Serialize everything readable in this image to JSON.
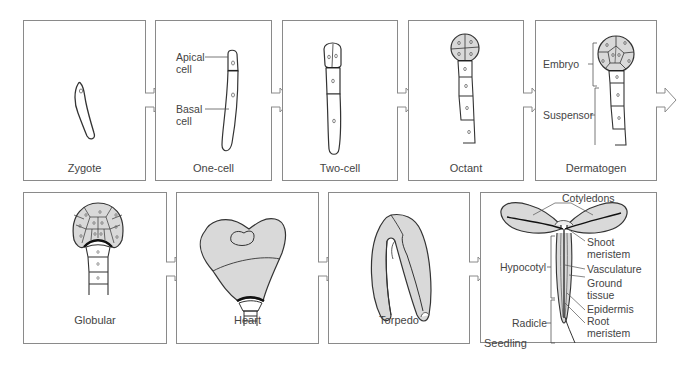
{
  "colors": {
    "panel_border": "#8a8a8a",
    "tissue_fill": "#d9d9d9",
    "outline": "#333333",
    "text": "#444444"
  },
  "stages": [
    {
      "id": "zygote",
      "caption": "Zygote",
      "labels": []
    },
    {
      "id": "one-cell",
      "caption": "One-cell",
      "labels": [
        {
          "text_line1": "Apical",
          "text_line2": "cell"
        },
        {
          "text_line1": "Basal",
          "text_line2": "cell"
        }
      ]
    },
    {
      "id": "two-cell",
      "caption": "Two-cell",
      "labels": []
    },
    {
      "id": "octant",
      "caption": "Octant",
      "labels": []
    },
    {
      "id": "dermatogen",
      "caption": "Dermatogen",
      "labels": [
        {
          "text": "Embryo"
        },
        {
          "text": "Suspensor"
        }
      ]
    },
    {
      "id": "globular",
      "caption": "Globular",
      "labels": []
    },
    {
      "id": "heart",
      "caption": "Heart",
      "labels": []
    },
    {
      "id": "torpedo",
      "caption": "Torpedo",
      "labels": []
    },
    {
      "id": "seedling",
      "caption": "Seedling",
      "labels": [
        {
          "text": "Cotyledons"
        },
        {
          "text_line1": "Shoot",
          "text_line2": "meristem"
        },
        {
          "text": "Hypocotyl"
        },
        {
          "text": "Vasculature"
        },
        {
          "text_line1": "Ground",
          "text_line2": "tissue"
        },
        {
          "text": "Epidermis"
        },
        {
          "text": "Radicle"
        },
        {
          "text_line1": "Root",
          "text_line2": "meristem"
        }
      ]
    }
  ],
  "arrows": [
    "zygote-to-one-cell",
    "one-cell-to-two-cell",
    "two-cell-to-octant",
    "octant-to-dermatogen",
    "dermatogen-to-next-row",
    "globular-to-heart",
    "heart-to-torpedo",
    "torpedo-to-seedling"
  ]
}
